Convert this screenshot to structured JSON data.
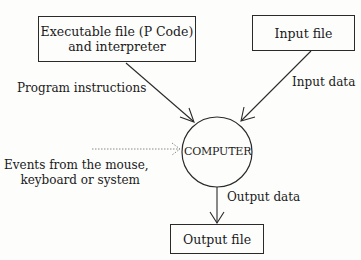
{
  "diagram": {
    "nodes": {
      "executable": {
        "line1": "Executable file (P Code)",
        "line2": "and interpreter"
      },
      "input_file": {
        "label": "Input file"
      },
      "computer": {
        "label": "COMPUTER"
      },
      "output_file": {
        "label": "Output file"
      }
    },
    "edges": {
      "program_instructions": {
        "label": "Program instructions",
        "from": "executable",
        "to": "computer",
        "style": "solid"
      },
      "input_data": {
        "label": "Input data",
        "from": "input_file",
        "to": "computer",
        "style": "solid"
      },
      "events": {
        "line1": "Events from the mouse,",
        "line2": "keyboard or system",
        "to": "computer",
        "style": "dotted"
      },
      "output_data": {
        "label": "Output data",
        "from": "computer",
        "to": "output_file",
        "style": "solid"
      }
    },
    "colors": {
      "line": "#2a2a2a",
      "dotted": "#8a8a8a",
      "background": "#fdfdfc"
    }
  }
}
